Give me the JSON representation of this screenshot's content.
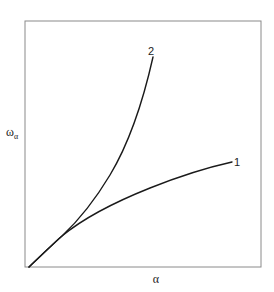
{
  "chart_data": {
    "type": "line",
    "title": "",
    "xlabel": "α",
    "ylabel": "ω_α",
    "ylabel_main": "ω",
    "ylabel_sub": "α",
    "grid": false,
    "legend": "inline labels at curve ends",
    "axis_ticks": "none",
    "xlim": [
      0,
      1
    ],
    "ylim": [
      0,
      1
    ],
    "series": [
      {
        "name": "1",
        "label": "1",
        "x": [
          0.0,
          0.1,
          0.2,
          0.34,
          0.52,
          0.66,
          0.87
        ],
        "y": [
          0.0,
          0.12,
          0.2,
          0.28,
          0.37,
          0.42,
          0.47
        ]
      },
      {
        "name": "2",
        "label": "2",
        "x": [
          0.0,
          0.1,
          0.18,
          0.26,
          0.34,
          0.42,
          0.53
        ],
        "y": [
          0.0,
          0.12,
          0.24,
          0.38,
          0.55,
          0.73,
          0.95
        ]
      }
    ]
  },
  "plot": {
    "frame": {
      "left": 25,
      "top": 21,
      "right": 261,
      "bottom": 267
    },
    "origin": [
      29,
      267
    ],
    "curve1_path": "M29,267 C45,252 55,242 62,236 C80,221 105,206 150,188 C180,176 205,168 232,162",
    "curve2_path": "M29,267 C45,252 55,242 62,236 C78,221 95,200 110,175 C125,150 140,115 153,57",
    "curve1_label_pos": [
      234,
      166
    ],
    "curve2_label_pos": [
      148,
      55
    ],
    "xlabel_pos": [
      156,
      283
    ],
    "ylabel_pos": [
      6,
      136
    ]
  }
}
